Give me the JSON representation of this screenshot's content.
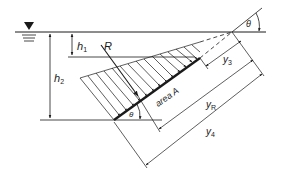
{
  "diagram": {
    "type": "hydrostatic-force-on-inclined-plane",
    "colors": {
      "line": "#1a1a1a",
      "background": "#ffffff"
    },
    "free_surface_symbol": "water-surface-triangle",
    "labels": {
      "h1": {
        "main": "h",
        "sub": "1"
      },
      "h2": {
        "main": "h",
        "sub": "2"
      },
      "R": "R",
      "area": "area A",
      "theta_top": "θ",
      "theta_bottom": "θ",
      "y3": {
        "main": "y",
        "sub": "3"
      },
      "yR": {
        "main": "y",
        "sub": "R"
      },
      "y4": {
        "main": "y",
        "sub": "4"
      }
    }
  }
}
